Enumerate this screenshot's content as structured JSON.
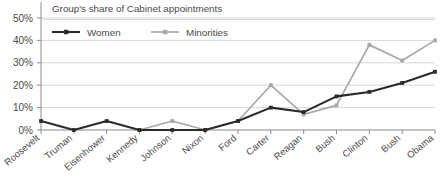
{
  "chart_data": {
    "type": "line",
    "title": "Group's share of Cabinet appointments",
    "xlabel": "",
    "ylabel": "",
    "ylim": [
      0,
      50
    ],
    "yticks": [
      "0%",
      "10%",
      "20%",
      "30%",
      "40%",
      "50%"
    ],
    "ytick_values": [
      0,
      10,
      20,
      30,
      40,
      50
    ],
    "grid": true,
    "legend_position": "top-left",
    "categories": [
      "Roosevelt",
      "Truman",
      "Eisenhower",
      "Kennedy",
      "Johnson",
      "Nixon",
      "Ford",
      "Carter",
      "Reagan",
      "Bush",
      "Clinton",
      "Bush",
      "Obama"
    ],
    "series": [
      {
        "name": "Women",
        "color": "#2b2b2b",
        "values": [
          4,
          0,
          4,
          0,
          0,
          0,
          4,
          10,
          8,
          15,
          17,
          21,
          26
        ]
      },
      {
        "name": "Minorities",
        "color": "#a8a8a8",
        "values": [
          null,
          null,
          null,
          0,
          4,
          0,
          4,
          20,
          7,
          11,
          38,
          31,
          40
        ]
      }
    ]
  },
  "legend": {
    "items": [
      {
        "label": "Women",
        "color": "#2b2b2b"
      },
      {
        "label": "Minorities",
        "color": "#a8a8a8"
      }
    ]
  },
  "colors": {
    "women": "#2b2b2b",
    "minorities": "#a8a8a8",
    "grid": "#d8d8d8",
    "axis": "#8a8a8a",
    "text": "#4a4a4a"
  }
}
